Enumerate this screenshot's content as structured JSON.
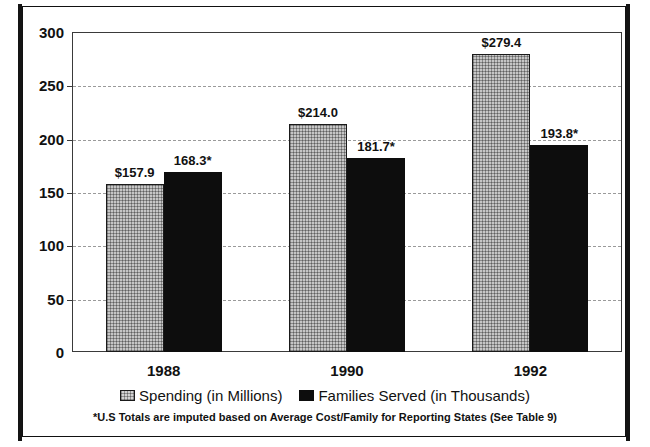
{
  "figure": {
    "title_partial": "",
    "frame_color": "#141414"
  },
  "chart_data": {
    "type": "bar",
    "title": "",
    "xlabel": "",
    "ylabel": "",
    "categories": [
      "1988",
      "1990",
      "1992"
    ],
    "ylim": [
      0,
      300
    ],
    "yticks": [
      0,
      50,
      100,
      150,
      200,
      250,
      300
    ],
    "ytick_labels": [
      "0",
      "50",
      "100",
      "150",
      "200",
      "250",
      "300"
    ],
    "grid": true,
    "grid_style": "dashed",
    "legend_position": "bottom",
    "series": [
      {
        "name": "Spending (in Millions)",
        "color": "#c6c6c6",
        "values": [
          157.9,
          214.0,
          279.4
        ],
        "data_labels": [
          "$157.9",
          "$214.0",
          "$279.4"
        ]
      },
      {
        "name": "Families Served (in Thousands)",
        "color": "#0d0d0d",
        "values": [
          168.3,
          181.7,
          193.8
        ],
        "data_labels": [
          "168.3*",
          "181.7*",
          "193.8*"
        ]
      }
    ],
    "annotations": [
      "*U.S Totals are imputed based on Average Cost/Family for Reporting States (See Table 9)"
    ]
  },
  "legend": {
    "items": [
      {
        "label": "Spending (in Millions)"
      },
      {
        "label": "Families Served (in Thousands)"
      }
    ]
  },
  "footnote": {
    "text": "*U.S Totals are imputed based on Average Cost/Family for Reporting States (See Table 9)"
  }
}
